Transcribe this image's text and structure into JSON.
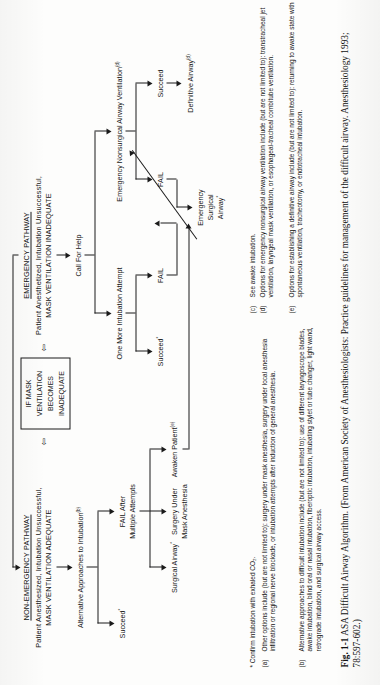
{
  "figure": {
    "caption_label": "Fig. 1-1",
    "caption_text": "ASA Difficult Airway Algorithm. (From American Society of Anesthesiologists: Practice guidelines for management of the difficult airway. Anesthesiology 1993; 78:597-602.)"
  },
  "pathways": {
    "nonemergency": {
      "title": "NON-EMERGENCY PATHWAY",
      "subtitle_line1": "Patient Anesthesized, Intubation Unsuccessful,",
      "subtitle_line2": "MASK VENTILATION ADEQUATE"
    },
    "emergency": {
      "title": "EMERGENCY PATHWAY",
      "subtitle_line1": "Patient Anesthetized, Intubation Unsuccessful,",
      "subtitle_line2": "MASK VENTILATION INADEQUATE"
    }
  },
  "transition_box": {
    "line1": "IF MASK",
    "line2": "VENTILATION",
    "line3": "BECOMES",
    "line4": "INADEQUATE",
    "connector_glyph": "⇦"
  },
  "nodes": {
    "alternative_approaches": {
      "label": "Alternative Approaches to Intubation",
      "sup": "(b)"
    },
    "succeed_left": {
      "label": "Succeed",
      "sup": "*"
    },
    "fail_after_multiple": {
      "line1": "FAIL After",
      "line2": "Multiple Attempts"
    },
    "surgical_airway_left": {
      "label": "Surgical Airway",
      "sup": "*"
    },
    "surgery_under_mask": {
      "line1": "Surgery Under",
      "line2": "Mask Anesthesia"
    },
    "awaken_patient": {
      "label": "Awaken Patient",
      "sup": "(e)"
    },
    "call_for_help": {
      "label": "Call For Help"
    },
    "one_more_attempt": {
      "label": "One More Intubation Attempt"
    },
    "succeed_emergency": {
      "label": "Succeed",
      "sup": "*"
    },
    "fail_emergency": {
      "label": "FAIL"
    },
    "emergency_nonsurgical": {
      "label": "Emergency Nonsurgical Airway Ventilation",
      "sup": "(d)"
    },
    "succeed_ensa": {
      "label": "Succeed"
    },
    "fail_ensa": {
      "label": "FAIL"
    },
    "definitive_airway": {
      "label": "Definitive Airway",
      "sup": "(d)"
    },
    "emergency_surgical_airway": {
      "line1": "Emergency",
      "line2": "Surgical",
      "line3": "Airway",
      "sup": "*"
    }
  },
  "footnotes": [
    {
      "label": "*",
      "text": "Confirm intubation with exhaled CO₂."
    },
    {
      "label": "(a)",
      "text": "Other options include (but are not limited to): surgery under mask anesthesia, surgery under local anesthesia infiltration or regional nerve blockade, or intubation attempts after induction of general anesthesia."
    },
    {
      "label": "(b)",
      "text": "Alternative approaches to difficult intubation include (but are not limited to): use of different laryngoscope blades, awake intubation, blind oral or nasal intubation, fiberoptic intubation, intubating stylet or tube changer, light wand, retrograde intubation, and surgical airway access."
    },
    {
      "label": "(c)",
      "text": "See awake intubation."
    },
    {
      "label": "(d)",
      "text": "Options for emergency nonsurgical airway ventilation include (but are not limited to): transtracheal jet ventilation, laryngeal mask ventilation, or esophageal-tracheal combitube ventilation."
    },
    {
      "label": "(e)",
      "text": "Options for establishing a definitive airway include (but are not limited to): returning to awake state with spontaneous ventilation, tracheotomy, or endotracheal intubation."
    }
  ],
  "colors": {
    "ink": "#141414",
    "paper": "#fdfdfc"
  }
}
